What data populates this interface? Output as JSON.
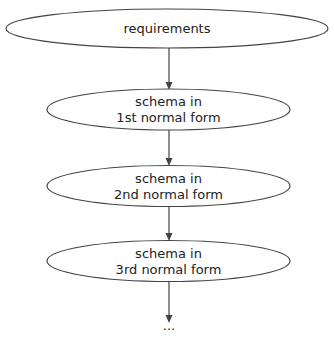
{
  "diagram": {
    "type": "flowchart",
    "direction": "top-to-bottom",
    "nodes": [
      {
        "id": "n1",
        "shape": "ellipse",
        "lines": [
          "requirements"
        ]
      },
      {
        "id": "n2",
        "shape": "ellipse",
        "lines": [
          "schema in",
          "1st normal form"
        ]
      },
      {
        "id": "n3",
        "shape": "ellipse",
        "lines": [
          "schema in",
          "2nd normal form"
        ]
      },
      {
        "id": "n4",
        "shape": "ellipse",
        "lines": [
          "schema in",
          "3rd normal form"
        ]
      },
      {
        "id": "n5",
        "shape": "plaintext",
        "lines": [
          "..."
        ]
      }
    ],
    "edges": [
      {
        "from": "n1",
        "to": "n2"
      },
      {
        "from": "n2",
        "to": "n3"
      },
      {
        "from": "n3",
        "to": "n4"
      },
      {
        "from": "n4",
        "to": "n5"
      }
    ],
    "colors": {
      "stroke": "#444444",
      "text": "#222222",
      "background": "#ffffff"
    }
  }
}
